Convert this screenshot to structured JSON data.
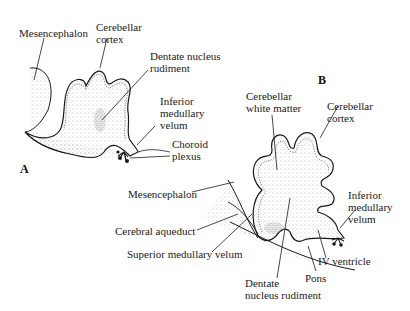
{
  "figure": {
    "panels": [
      {
        "id": "A",
        "label": "A"
      },
      {
        "id": "B",
        "label": "B"
      }
    ],
    "panel_a": {
      "labels": {
        "mesencephalon": "Mesencephalon",
        "cerebellar_cortex_1": "Cerebellar",
        "cerebellar_cortex_2": "cortex",
        "dentate_1": "Dentate nucleus",
        "dentate_2": "rudiment",
        "inferior_1": "Inferior",
        "inferior_2": "medullary",
        "inferior_3": "velum",
        "choroid_1": "Choroid",
        "choroid_2": "plexus"
      }
    },
    "panel_b": {
      "labels": {
        "white_matter_1": "Cerebellar",
        "white_matter_2": "white matter",
        "cortex_1": "Cerebellar",
        "cortex_2": "cortex",
        "inferior_1": "Inferior",
        "inferior_2": "medullary",
        "inferior_3": "velum",
        "mesencephalon": "Mesencephalon",
        "cerebral_aqueduct": "Cerebral aqueduct",
        "superior_velum": "Superior medullary velum",
        "iv_ventricle": "IV ventricle",
        "pons": "Pons",
        "dentate_1": "Dentate",
        "dentate_2": "nucleus rudiment"
      }
    },
    "colors": {
      "ink": "#1a1a1a",
      "stipple": "#888888",
      "background": "#ffffff"
    }
  }
}
